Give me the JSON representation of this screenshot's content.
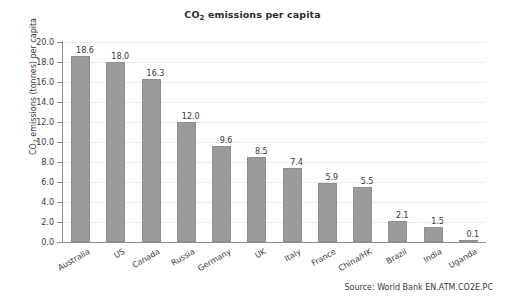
{
  "chart_data": {
    "type": "bar",
    "title": "CO2 emissions per capita",
    "title_parts": {
      "pre": "CO",
      "sub": "2",
      "post": " emissions per capita"
    },
    "xlabel": "",
    "ylabel": "CO2 emissions (tonnes) per capita",
    "ylabel_parts": {
      "pre": "CO",
      "sub": "2",
      "post": " emissions (tonnes) per capita"
    },
    "categories": [
      "Australia",
      "US",
      "Canada",
      "Russia",
      "Germany",
      "UK",
      "Italy",
      "France",
      "China/HK",
      "Brazil",
      "India",
      "Uganda"
    ],
    "values": [
      18.6,
      18.0,
      16.3,
      12.0,
      9.6,
      8.5,
      7.4,
      5.9,
      5.5,
      2.1,
      1.5,
      0.1
    ],
    "value_labels": [
      "18.6",
      "18.0",
      "16.3",
      "12.0",
      "9.6",
      "8.5",
      "7.4",
      "5.9",
      "5.5",
      "2.1",
      "1.5",
      "0.1"
    ],
    "ylim": [
      0.0,
      20.0
    ],
    "ytick_values": [
      20.0,
      18.0,
      16.0,
      14.0,
      12.0,
      10.0,
      8.0,
      6.0,
      4.0,
      2.0,
      0.0
    ],
    "ytick_labels": [
      "20.0",
      "18.0",
      "16.0",
      "14.0",
      "12.0",
      "10.0",
      "8.0",
      "6.0",
      "4.0",
      "2.0",
      "0.0"
    ],
    "grid": true,
    "grid_axis": "y",
    "legend": false,
    "bar_color": "#9b9b9b",
    "grid_color": "#ebebeb",
    "axis_color": "#8c8c8c",
    "text_color": "#3a3a3a",
    "background": "#ffffff"
  },
  "source": {
    "text": "Source: World Bank EN.ATM.CO2E.PC"
  }
}
